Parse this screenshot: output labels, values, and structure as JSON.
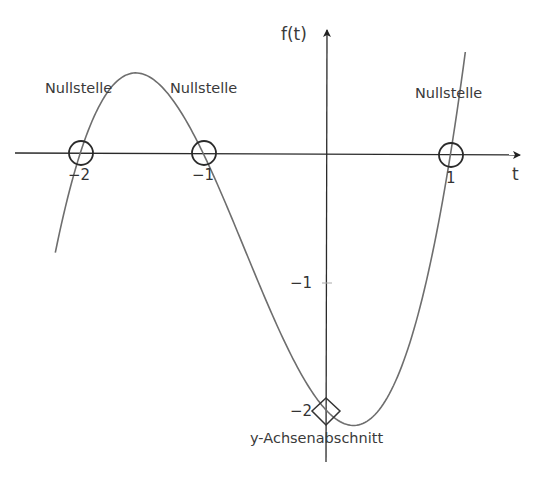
{
  "chart_data": {
    "type": "line",
    "title": "",
    "function": "f(t) = (t+2)(t+1)(t-1) = t^3 + 2t^2 - t - 2",
    "xlabel": "t",
    "ylabel": "f(t)",
    "xlim": [
      -2.65,
      1.55
    ],
    "ylim": [
      -2.4,
      0.95
    ],
    "grid": false,
    "x_ticks": [
      -2,
      -1,
      1
    ],
    "x_tick_labels": [
      "−2",
      "−1",
      "1"
    ],
    "y_ticks": [
      -1,
      -2
    ],
    "y_tick_labels": [
      "−1",
      "−2"
    ],
    "series": [
      {
        "name": "f(t)",
        "t_range": [
          -2.2,
          1.12
        ],
        "color": "#6e6e6e",
        "x": [
          -2.2,
          -2.0,
          -1.8,
          -1.55,
          -1.4,
          -1.2,
          -1.0,
          -0.8,
          -0.6,
          -0.4,
          -0.2,
          0.0,
          0.2,
          0.4,
          0.6,
          0.8,
          1.0,
          1.12
        ],
        "y": [
          -0.768,
          0.0,
          0.448,
          0.631,
          0.576,
          0.352,
          0.0,
          -0.432,
          -0.896,
          -1.344,
          -1.728,
          -2.0,
          -2.112,
          -2.016,
          -1.664,
          -1.008,
          0.0,
          0.774
        ]
      }
    ],
    "annotations": [
      {
        "type": "circle",
        "t": -2,
        "f": 0,
        "label": "Nullstelle"
      },
      {
        "type": "circle",
        "t": -1,
        "f": 0,
        "label": "Nullstelle"
      },
      {
        "type": "circle",
        "t": 1,
        "f": 0,
        "label": "Nullstelle"
      },
      {
        "type": "diamond",
        "t": 0,
        "f": -2,
        "label": "y-Achsenabschnitt"
      }
    ]
  },
  "axes": {
    "x_label": "t",
    "y_label": "f(t)"
  },
  "labels": {
    "root_1": "Nullstelle",
    "root_2": "Nullstelle",
    "root_3": "Nullstelle",
    "intercept": "y-Achsenabschnitt"
  },
  "ticks": {
    "x_m2": "−2",
    "x_m1": "−1",
    "x_p1": "1",
    "y_m1": "−1",
    "y_m2": "−2"
  }
}
